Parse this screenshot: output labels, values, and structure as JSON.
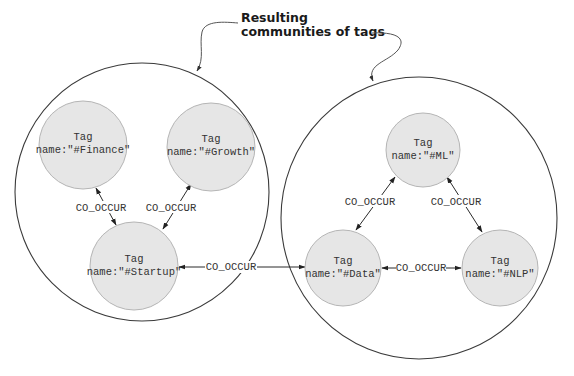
{
  "callout": {
    "line1": "Resulting",
    "line2": "communities of tags"
  },
  "communities": [
    {
      "id": "community-left",
      "nodes": [
        {
          "id": "finance",
          "label": "Tag",
          "name": "name:\"#Finance\""
        },
        {
          "id": "growth",
          "label": "Tag",
          "name": "name:\"#Growth\""
        },
        {
          "id": "startup",
          "label": "Tag",
          "name": "name:\"#Startup\""
        }
      ]
    },
    {
      "id": "community-right",
      "nodes": [
        {
          "id": "ml",
          "label": "Tag",
          "name": "name:\"#ML\""
        },
        {
          "id": "data",
          "label": "Tag",
          "name": "name:\"#Data\""
        },
        {
          "id": "nlp",
          "label": "Tag",
          "name": "name:\"#NLP\""
        }
      ]
    }
  ],
  "edges": [
    {
      "from": "finance",
      "to": "startup",
      "label": "CO_OCCUR"
    },
    {
      "from": "growth",
      "to": "startup",
      "label": "CO_OCCUR"
    },
    {
      "from": "startup",
      "to": "data",
      "label": "CO_OCCUR"
    },
    {
      "from": "ml",
      "to": "data",
      "label": "CO_OCCUR"
    },
    {
      "from": "ml",
      "to": "nlp",
      "label": "CO_OCCUR"
    },
    {
      "from": "data",
      "to": "nlp",
      "label": "CO_OCCUR"
    }
  ]
}
